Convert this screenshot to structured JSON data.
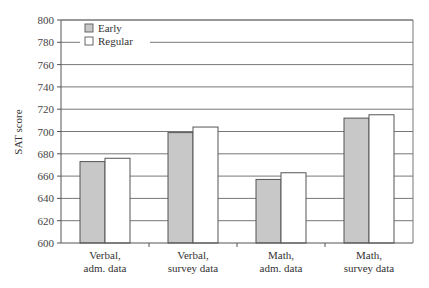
{
  "chart_data": {
    "type": "bar",
    "title": "",
    "xlabel": "",
    "ylabel": "SAT score",
    "ylim": [
      600,
      800
    ],
    "yticks": [
      600,
      620,
      640,
      660,
      680,
      700,
      720,
      740,
      760,
      780,
      800
    ],
    "grid": true,
    "legend_position": "top-left",
    "categories": [
      [
        "Verbal,",
        "adm. data"
      ],
      [
        "Verbal,",
        "survey data"
      ],
      [
        "Math,",
        "adm. data"
      ],
      [
        "Math,",
        "survey data"
      ]
    ],
    "series": [
      {
        "name": "Early",
        "color": "#c8c8c8",
        "values": [
          673,
          699,
          657,
          712
        ]
      },
      {
        "name": "Regular",
        "color": "#ffffff",
        "values": [
          676,
          704,
          663,
          715
        ]
      }
    ]
  }
}
